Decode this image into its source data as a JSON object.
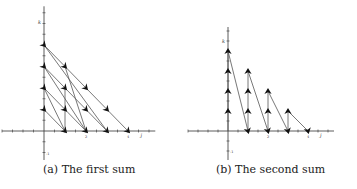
{
  "figure": {
    "panels": [
      {
        "id": "a",
        "caption": "(a) The first sum",
        "caption_x": 43,
        "origin": [
          44,
          131
        ],
        "unit": [
          21,
          21.5
        ],
        "x_range": [
          -2,
          5.3
        ],
        "y_range": [
          -1.6,
          5.8
        ],
        "x_label": "j",
        "y_label": "k",
        "tick_labels": [
          {
            "axis": "x",
            "value": 2,
            "text": "2"
          },
          {
            "axis": "x",
            "value": 4,
            "text": "4"
          },
          {
            "axis": "y",
            "value": -1,
            "text": "-1"
          }
        ],
        "arrowheads": [
          [
            0,
            4
          ],
          [
            1,
            3
          ],
          [
            2,
            2
          ],
          [
            3,
            1
          ],
          [
            4,
            0
          ],
          [
            0,
            3
          ],
          [
            1,
            2
          ],
          [
            2,
            1
          ],
          [
            3,
            0
          ],
          [
            0,
            2
          ],
          [
            1,
            1
          ],
          [
            2,
            0
          ],
          [
            0,
            1
          ],
          [
            1,
            0
          ]
        ],
        "segments": [
          [
            [
              0,
              4
            ],
            [
              4,
              0
            ]
          ],
          [
            [
              0,
              3
            ],
            [
              3,
              0
            ]
          ],
          [
            [
              0,
              2
            ],
            [
              2,
              0
            ]
          ],
          [
            [
              0,
              1
            ],
            [
              1,
              0
            ]
          ],
          [
            [
              0,
              4
            ],
            [
              3,
              0
            ]
          ],
          [
            [
              0,
              3
            ],
            [
              2,
              0
            ]
          ],
          [
            [
              0,
              2
            ],
            [
              1,
              0
            ]
          ],
          [
            [
              1,
              3
            ],
            [
              2,
              0
            ]
          ],
          [
            [
              1,
              2
            ],
            [
              1,
              0
            ]
          ]
        ]
      },
      {
        "id": "b",
        "caption": "(b) The second sum",
        "caption_x": 216,
        "origin": [
          228,
          131
        ],
        "unit": [
          20,
          20
        ],
        "x_range": [
          -2,
          5.3
        ],
        "y_range": [
          -1.6,
          5.2
        ],
        "x_label": "j",
        "y_label": "k",
        "tick_labels": [
          {
            "axis": "x",
            "value": 2,
            "text": "2"
          },
          {
            "axis": "x",
            "value": 4,
            "text": "4"
          },
          {
            "axis": "y",
            "value": -1,
            "text": "-1"
          }
        ],
        "arrowheads": [
          [
            0,
            1
          ],
          [
            0,
            2
          ],
          [
            0,
            3
          ],
          [
            0,
            4
          ],
          [
            1,
            1
          ],
          [
            1,
            2
          ],
          [
            1,
            3
          ],
          [
            2,
            1
          ],
          [
            2,
            2
          ],
          [
            3,
            1
          ],
          [
            1,
            0
          ],
          [
            2,
            0
          ],
          [
            3,
            0
          ],
          [
            4,
            0
          ]
        ],
        "segments": [
          [
            [
              0,
              0
            ],
            [
              0,
              4
            ]
          ],
          [
            [
              0,
              4
            ],
            [
              1,
              0
            ]
          ],
          [
            [
              1,
              0
            ],
            [
              1,
              3
            ]
          ],
          [
            [
              1,
              3
            ],
            [
              2,
              0
            ]
          ],
          [
            [
              2,
              0
            ],
            [
              2,
              2
            ]
          ],
          [
            [
              2,
              2
            ],
            [
              3,
              0
            ]
          ],
          [
            [
              3,
              0
            ],
            [
              3,
              1
            ]
          ],
          [
            [
              3,
              1
            ],
            [
              4,
              0
            ]
          ]
        ]
      }
    ],
    "colors": {
      "axis": "#333333",
      "line": "#555555",
      "arrow": "#111111",
      "caption": "#222222"
    }
  }
}
